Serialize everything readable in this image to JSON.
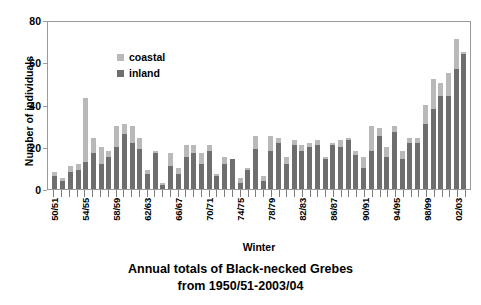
{
  "chart_data": {
    "type": "bar",
    "subtype": "stacked-bar",
    "title": "Annual totals of Black-necked Grebes",
    "subtitle": "from 1950/51-2003/04",
    "xlabel": "Winter",
    "ylabel": "Number of individuals",
    "ylim": [
      0,
      80
    ],
    "yticks": [
      0,
      20,
      40,
      60,
      80
    ],
    "grid": false,
    "legend_position": "top-left",
    "categories": [
      "50/51",
      "51/52",
      "52/53",
      "53/54",
      "54/55",
      "55/56",
      "56/57",
      "57/58",
      "58/59",
      "59/60",
      "60/61",
      "61/62",
      "62/63",
      "63/64",
      "64/65",
      "65/66",
      "66/67",
      "67/68",
      "68/69",
      "69/70",
      "70/71",
      "71/72",
      "72/73",
      "73/74",
      "74/75",
      "75/76",
      "76/77",
      "77/78",
      "78/79",
      "79/80",
      "80/81",
      "81/82",
      "82/83",
      "83/84",
      "84/85",
      "85/86",
      "86/87",
      "87/88",
      "88/89",
      "89/90",
      "90/91",
      "91/92",
      "92/93",
      "93/94",
      "94/95",
      "95/96",
      "96/97",
      "97/98",
      "98/99",
      "99/00",
      "00/01",
      "01/02",
      "02/03",
      "03/04"
    ],
    "tick_labels": [
      "50/51",
      "",
      "",
      "",
      "54/55",
      "",
      "",
      "",
      "58/59",
      "",
      "",
      "",
      "62/63",
      "",
      "",
      "",
      "66/67",
      "",
      "",
      "",
      "70/71",
      "",
      "",
      "",
      "74/75",
      "",
      "",
      "",
      "78/79",
      "",
      "",
      "",
      "82/83",
      "",
      "",
      "",
      "86/87",
      "",
      "",
      "",
      "90/91",
      "",
      "",
      "",
      "94/95",
      "",
      "",
      "",
      "98/99",
      "",
      "",
      "",
      "02/03",
      ""
    ],
    "series": [
      {
        "name": "inland",
        "color": "#6e6e6e",
        "values": [
          6,
          4,
          8,
          9,
          13,
          17,
          12,
          15,
          20,
          26,
          22,
          19,
          7,
          17,
          2,
          11,
          7,
          15,
          17,
          12,
          18,
          6,
          12,
          14,
          3,
          9,
          19,
          4,
          18,
          22,
          12,
          21,
          18,
          20,
          21,
          14,
          21,
          20,
          23,
          16,
          10,
          18,
          25,
          15,
          27,
          14,
          22,
          22,
          31,
          38,
          44,
          44,
          57,
          64
        ]
      },
      {
        "name": "coastal",
        "color": "#b9b9b9",
        "values": [
          2,
          1,
          3,
          3,
          30,
          7,
          8,
          3,
          10,
          5,
          8,
          5,
          2,
          1,
          1,
          6,
          3,
          6,
          4,
          5,
          3,
          1,
          3,
          0,
          2,
          1,
          6,
          2,
          7,
          2,
          3,
          2,
          3,
          2,
          2,
          1,
          1,
          3,
          1,
          2,
          5,
          12,
          4,
          5,
          3,
          4,
          2,
          2,
          9,
          14,
          6,
          11,
          14,
          1
        ]
      }
    ],
    "totals": [
      8,
      5,
      11,
      12,
      43,
      24,
      20,
      18,
      30,
      31,
      30,
      24,
      9,
      18,
      3,
      17,
      10,
      21,
      21,
      17,
      21,
      7,
      15,
      14,
      5,
      10,
      25,
      6,
      25,
      24,
      15,
      23,
      21,
      22,
      23,
      15,
      22,
      23,
      24,
      18,
      15,
      30,
      29,
      20,
      30,
      18,
      24,
      24,
      40,
      52,
      50,
      55,
      71,
      65
    ]
  },
  "legend": {
    "items": [
      {
        "label": "coastal"
      },
      {
        "label": "inland"
      }
    ]
  }
}
